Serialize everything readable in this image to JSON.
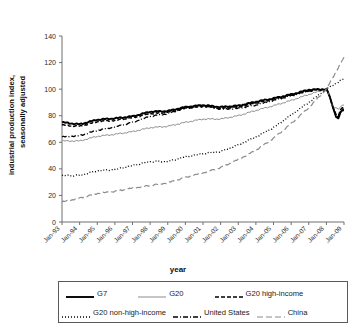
{
  "chart_data": {
    "type": "line",
    "title": "",
    "xlabel": "year",
    "ylabel": "industrial production index, seasonally adjusted",
    "ylabel_line1": "industrial production index,",
    "ylabel_line2": "seasonally adjusted",
    "ylim": [
      0,
      140
    ],
    "yticks": [
      0,
      20,
      40,
      60,
      80,
      100,
      120,
      140
    ],
    "grid": false,
    "legend_position": "bottom",
    "x": [
      "Jan-93",
      "Jan-94",
      "Jan-95",
      "Jan-96",
      "Jan-97",
      "Jan-98",
      "Jan-99",
      "Jan-00",
      "Jan-01",
      "Jan-02",
      "Jan-03",
      "Jan-04",
      "Jan-05",
      "Jan-06",
      "Jan-07",
      "Jan-08",
      "Jan-09"
    ],
    "xtick_labels": [
      "Jan-93",
      "Jan-94",
      "Jan-95",
      "Jan-96",
      "Jan-97",
      "Jan-98",
      "Jan-99",
      "Jan-00",
      "Jan-01",
      "Jan-02",
      "Jan-03",
      "Jan-04",
      "Jan-05",
      "Jan-06",
      "Jan-07",
      "Jan-08",
      "Jan-09"
    ],
    "series": [
      {
        "name": "G7",
        "style": "solid",
        "color": "#000000",
        "width": 1.9,
        "dash": "",
        "values": [
          75,
          73.5,
          77,
          78,
          79.5,
          83,
          83.5,
          86.5,
          88,
          86.5,
          87.5,
          90.5,
          93,
          96,
          99.5,
          100,
          84
        ]
      },
      {
        "name": "G20",
        "style": "solid",
        "color": "#8c8c8c",
        "width": 1.0,
        "dash": "",
        "values": [
          61,
          61,
          64.5,
          66,
          68,
          71,
          72,
          75,
          77.5,
          77.5,
          80,
          84,
          87.5,
          91.5,
          96,
          100,
          88
        ]
      },
      {
        "name": "G20 high-income",
        "style": "dashed",
        "color": "#000000",
        "width": 1.4,
        "dash": "4,2",
        "values": [
          73,
          72,
          75.5,
          76.5,
          78.5,
          81.5,
          82.5,
          85.5,
          87,
          85.5,
          86.5,
          89.5,
          92.5,
          95.5,
          99,
          100,
          86
        ]
      },
      {
        "name": "G20 non-high-income",
        "style": "dotted",
        "color": "#000000",
        "width": 1.3,
        "dash": "1,2",
        "values": [
          35,
          35,
          38.5,
          39.5,
          42.5,
          45.5,
          45.5,
          49,
          51.5,
          53,
          58,
          64,
          71,
          80.5,
          90,
          100,
          108
        ]
      },
      {
        "name": "United States",
        "style": "dash-dot",
        "color": "#000000",
        "width": 1.3,
        "dash": "5,2,1,2",
        "values": [
          64,
          65,
          69,
          71.5,
          75,
          79.5,
          81.5,
          86,
          87.5,
          85,
          85.5,
          88,
          91.5,
          95,
          98.5,
          100,
          85
        ]
      },
      {
        "name": "China",
        "style": "long-dash",
        "color": "#8c8c8c",
        "width": 1.2,
        "dash": "6,3",
        "values": [
          15,
          18,
          21.5,
          23,
          25.5,
          27.5,
          29.5,
          33.5,
          37,
          41,
          47,
          54,
          63,
          74,
          86,
          100,
          124
        ]
      }
    ]
  },
  "axis": {
    "x_title": "year",
    "y_title_line1": "industrial production index,",
    "y_title_line2": "seasonally adjusted"
  },
  "legend": {
    "row1": [
      {
        "label": "G7",
        "key": "solid-thick"
      },
      {
        "label": "G20",
        "key": "solid-thin-gray"
      },
      {
        "label": "G20 high-income",
        "key": "dashed"
      }
    ],
    "row2": [
      {
        "label": "G20 non-high-income",
        "key": "dotted"
      },
      {
        "label": "United States",
        "key": "dash-dot"
      },
      {
        "label": "China",
        "key": "long-dash-gray"
      }
    ]
  }
}
